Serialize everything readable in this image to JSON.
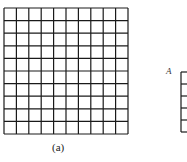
{
  "figure": {
    "caption": "(a)",
    "main_grid": {
      "rows": 10,
      "cols": 10,
      "x": 4,
      "y": 8,
      "width": 124,
      "height": 126,
      "line_color": "#1a1a1a"
    },
    "partial_grid": {
      "label": "A",
      "x": 181,
      "y": 72,
      "visible_rows": 5,
      "row_height": 12
    }
  }
}
